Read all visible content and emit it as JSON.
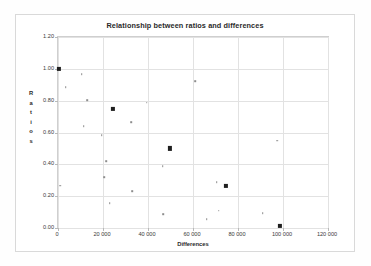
{
  "chart": {
    "title": "Relationship between ratios and differences",
    "xlabel": "Differences",
    "ylabel_letters": [
      "R",
      "a",
      "t",
      "i",
      "o",
      "s"
    ],
    "ylabel": "Ratios",
    "y_ticks": [
      "0.00",
      "0.20",
      "0.40",
      "0.60",
      "0.80",
      "1.00",
      "1.20"
    ],
    "x_ticks": [
      "0",
      "20 000",
      "40 000",
      "60 000",
      "80 000",
      "100 000",
      "120 000"
    ]
  },
  "chart_data": {
    "type": "scatter",
    "title": "Relationship between ratios and differences",
    "xlabel": "Differences",
    "ylabel": "Ratios",
    "xlim": [
      0,
      120000
    ],
    "ylim": [
      0.0,
      1.2
    ],
    "xtick_values": [
      0,
      20000,
      40000,
      60000,
      80000,
      100000,
      120000
    ],
    "xtick_labels": [
      "0",
      "20 000",
      "40 000",
      "60 000",
      "80 000",
      "100 000",
      "120 000"
    ],
    "ytick_values": [
      0.0,
      0.2,
      0.4,
      0.6,
      0.8,
      1.0,
      1.2
    ],
    "ytick_labels": [
      "0.00",
      "0.20",
      "0.40",
      "0.60",
      "0.80",
      "1.00",
      "1.20"
    ],
    "grid": true,
    "legend": false,
    "marker_color": "#2b2b2b",
    "points": [
      {
        "x": 300,
        "y": 1.0,
        "size": "big"
      },
      {
        "x": 1000,
        "y": 0.265,
        "size": "small"
      },
      {
        "x": 3500,
        "y": 0.885,
        "size": "small"
      },
      {
        "x": 10500,
        "y": 0.965,
        "size": "small"
      },
      {
        "x": 11500,
        "y": 0.638,
        "size": "small"
      },
      {
        "x": 13000,
        "y": 0.802,
        "size": "small"
      },
      {
        "x": 19500,
        "y": 0.583,
        "size": "small"
      },
      {
        "x": 20500,
        "y": 0.32,
        "size": "small"
      },
      {
        "x": 21500,
        "y": 0.42,
        "size": "small"
      },
      {
        "x": 23000,
        "y": 0.157,
        "size": "small"
      },
      {
        "x": 24500,
        "y": 0.748,
        "size": "big"
      },
      {
        "x": 32500,
        "y": 0.663,
        "size": "small"
      },
      {
        "x": 33000,
        "y": 0.233,
        "size": "small"
      },
      {
        "x": 39500,
        "y": 0.787,
        "size": "small"
      },
      {
        "x": 46500,
        "y": 0.388,
        "size": "small"
      },
      {
        "x": 46800,
        "y": 0.085,
        "size": "small"
      },
      {
        "x": 49800,
        "y": 0.5,
        "size": "big"
      },
      {
        "x": 61000,
        "y": 0.922,
        "size": "small"
      },
      {
        "x": 66000,
        "y": 0.057,
        "size": "small"
      },
      {
        "x": 70500,
        "y": 0.288,
        "size": "small"
      },
      {
        "x": 71500,
        "y": 0.108,
        "size": "small"
      },
      {
        "x": 74500,
        "y": 0.262,
        "size": "big"
      },
      {
        "x": 91000,
        "y": 0.092,
        "size": "small"
      },
      {
        "x": 97500,
        "y": 0.548,
        "size": "small"
      },
      {
        "x": 98800,
        "y": 0.013,
        "size": "big"
      }
    ]
  }
}
